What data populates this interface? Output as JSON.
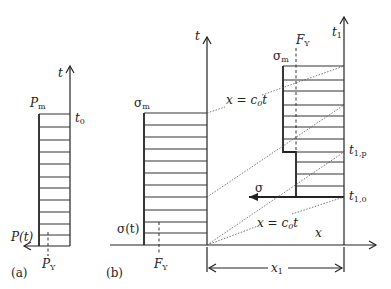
{
  "panel_a": {
    "caption": "(a)",
    "axis_t_label": "t",
    "axis_p_label": "P(t)",
    "top_label_main": "P",
    "top_label_sub": "m",
    "t0_main": "t",
    "t0_sub": "0",
    "py_main": "P",
    "py_sub": "Y"
  },
  "panel_b": {
    "caption": "(b)",
    "axis_t_label": "t",
    "axis_t1_main": "t",
    "axis_t1_sub": "1",
    "axis_x_label": "x",
    "sigma_m_main": "σ",
    "sigma_m_sub": "m",
    "sigma_t": "σ(t)",
    "fy_main": "F",
    "fy_sub": "Y",
    "sigma_m2_main": "σ",
    "sigma_m2_sub": "m",
    "fy2_main": "F",
    "fy2_sub": "Y",
    "wave_upper_label_a": "x = c",
    "wave_upper_label_sub": "0",
    "wave_upper_label_b": "t",
    "wave_lower_label_a": "x = c",
    "wave_lower_label_sub": "0",
    "wave_lower_label_b": "t",
    "sigma_arrow_label": "σ",
    "t1p_main": "t",
    "t1p_sub": "1,p",
    "t10_main": "t",
    "t10_sub": "1,0",
    "x1_main": "x",
    "x1_sub": "1"
  }
}
